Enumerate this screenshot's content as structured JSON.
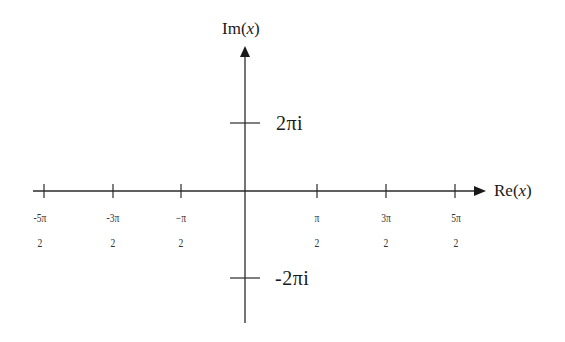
{
  "diagram": {
    "type": "complex-plane",
    "axes": {
      "horizontal_label": "Re(x)",
      "horizontal_label_prefix": "Re(",
      "horizontal_label_var": "x",
      "horizontal_label_suffix": ")",
      "vertical_label_prefix": "Im(",
      "vertical_label_var": "x",
      "vertical_label_suffix": ")"
    },
    "real_ticks": [
      {
        "num": "-5π",
        "den": "2"
      },
      {
        "num": "-3π",
        "den": "2"
      },
      {
        "num": "−π",
        "den": "2"
      },
      {
        "num": "π",
        "den": "2"
      },
      {
        "num": "3π",
        "den": "2"
      },
      {
        "num": "5π",
        "den": "2"
      }
    ],
    "imag_ticks": [
      {
        "label": "2πi"
      },
      {
        "label": "-2πi"
      }
    ],
    "colors": {
      "line": "#2a2a2a",
      "text": "#1a1a1a"
    }
  }
}
